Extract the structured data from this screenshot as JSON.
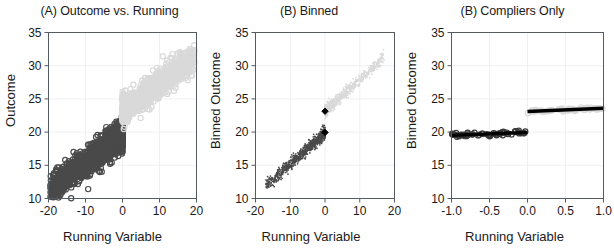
{
  "figure": {
    "width": 614,
    "height": 252,
    "background": "#ffffff"
  },
  "colors": {
    "treated_light": "#d9d9d9",
    "control_dark": "#4a4a4a",
    "marker_black": "#000000",
    "axis": "#555b5e",
    "grid": "#f0f0f0"
  },
  "panels": [
    {
      "id": "panel-a",
      "title": "(A) Outcome vs. Running",
      "xlabel": "Running Variable",
      "ylabel": "Outcome"
    },
    {
      "id": "panel-b",
      "title": "(B) Binned",
      "xlabel": "Running Variable",
      "ylabel": "Binned Outcome"
    },
    {
      "id": "panel-c",
      "title": "(B) Compliers Only",
      "xlabel": "Running Variable",
      "ylabel": "Binned Outcome"
    }
  ],
  "chart_data": [
    {
      "type": "scatter",
      "panel": "A",
      "title": "(A) Outcome vs. Running",
      "xlabel": "Running Variable",
      "ylabel": "Outcome",
      "xlim": [
        -20,
        20
      ],
      "ylim": [
        10,
        35
      ],
      "xticks": [
        -20,
        -10,
        0,
        10,
        20
      ],
      "xticklabels": [
        "-20",
        "-10",
        "0",
        "10",
        "20"
      ],
      "yticks": [
        10,
        15,
        20,
        25,
        30,
        35
      ],
      "yticklabels": [
        "10",
        "15",
        "20",
        "25",
        "30",
        "35"
      ],
      "grid": false,
      "legend": "none",
      "cutoff": 0,
      "series": [
        {
          "name": "below-cutoff-control",
          "color": "#4a4a4a",
          "marker": "open-circle",
          "n_points": 1400,
          "x_range": [
            -19.5,
            0
          ],
          "trend_intercept": 19.6,
          "trend_slope": 0.42,
          "y_noise_sd": 1.1,
          "x_distribution": "left-skewed-dense-near-zero"
        },
        {
          "name": "above-cutoff-treated",
          "color": "#d9d9d9",
          "marker": "open-circle",
          "n_points": 1100,
          "x_range": [
            0,
            19.5
          ],
          "trend_intercept": 23.2,
          "trend_slope": 0.42,
          "y_noise_sd": 1.0,
          "x_distribution": "right-skewed-dense-near-zero"
        }
      ],
      "discontinuity_at_zero": 3.6
    },
    {
      "type": "scatter",
      "panel": "B",
      "title": "(B) Binned",
      "xlabel": "Running Variable",
      "ylabel": "Binned Outcome",
      "xlim": [
        -20,
        20
      ],
      "ylim": [
        10,
        35
      ],
      "xticks": [
        -20,
        -10,
        0,
        10,
        20
      ],
      "xticklabels": [
        "-20",
        "-10",
        "0",
        "10",
        "20"
      ],
      "yticks": [
        10,
        15,
        20,
        25,
        30,
        35
      ],
      "yticklabels": [
        "10",
        "15",
        "20",
        "25",
        "30",
        "35"
      ],
      "grid": false,
      "legend": "none",
      "cutoff": 0,
      "series": [
        {
          "name": "binned-below-cutoff",
          "color": "#4a4a4a",
          "marker": "small-dot",
          "n_points": 900,
          "x_range": [
            -17,
            0
          ],
          "trend_intercept": 19.9,
          "trend_slope": 0.47,
          "y_noise_sd": 0.45,
          "x_distribution": "dense-near-zero"
        },
        {
          "name": "binned-above-cutoff",
          "color": "#d9d9d9",
          "marker": "small-dot",
          "n_points": 700,
          "x_range": [
            0,
            17
          ],
          "trend_intercept": 23.2,
          "trend_slope": 0.47,
          "y_noise_sd": 0.45,
          "x_distribution": "dense-near-zero"
        },
        {
          "name": "cutoff-mean-below",
          "color": "#000000",
          "marker": "filled-diamond",
          "points": [
            {
              "x": 0,
              "y": 19.95
            }
          ]
        },
        {
          "name": "cutoff-mean-above",
          "color": "#000000",
          "marker": "filled-diamond",
          "points": [
            {
              "x": 0,
              "y": 23.15
            }
          ]
        }
      ],
      "discontinuity_at_zero": 3.2
    },
    {
      "type": "scatter",
      "panel": "C",
      "title": "(B) Compliers Only",
      "xlabel": "Running Variable",
      "ylabel": "Binned Outcome",
      "xlim": [
        -1.0,
        1.0
      ],
      "ylim": [
        10,
        35
      ],
      "xticks": [
        -1.0,
        -0.5,
        0.0,
        0.5,
        1.0
      ],
      "xticklabels": [
        "-1.0",
        "-0.5",
        "0.0",
        "0.5",
        "1.0"
      ],
      "yticks": [
        10,
        15,
        20,
        25,
        30,
        35
      ],
      "yticklabels": [
        "10",
        "15",
        "20",
        "25",
        "30",
        "35"
      ],
      "grid": false,
      "legend": "none",
      "cutoff": 0,
      "series": [
        {
          "name": "compliers-below-cutoff",
          "color": "#3a3a3a",
          "marker": "open-circle",
          "n_points": 60,
          "x_range": [
            -1.0,
            0.0
          ],
          "trend_intercept": 19.95,
          "trend_slope": 0.45,
          "y_noise_sd": 0.18
        },
        {
          "name": "compliers-above-cutoff",
          "color": "#d9d9d9",
          "marker": "open-circle",
          "n_points": 60,
          "x_range": [
            0.0,
            1.0
          ],
          "trend_intercept": 23.1,
          "trend_slope": 0.5,
          "y_noise_sd": 0.12
        }
      ],
      "fit_lines": [
        {
          "name": "fit-below-cutoff",
          "x0": -1.0,
          "y0": 19.5,
          "x1": 0.0,
          "y1": 19.95,
          "color": "#000000"
        },
        {
          "name": "fit-above-cutoff",
          "x0": 0.0,
          "y0": 23.1,
          "x1": 1.0,
          "y1": 23.6,
          "color": "#000000"
        }
      ],
      "discontinuity_at_zero": 3.15
    }
  ]
}
